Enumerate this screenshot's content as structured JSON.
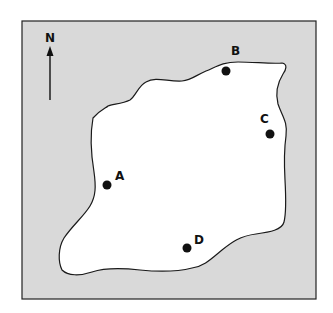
{
  "figure": {
    "compass_label": "N",
    "background_color": "#d9d9d9",
    "island_color": "#ffffff",
    "outline_color": "#1a1a1a",
    "points": [
      {
        "label": "A",
        "dot": [
          107,
          185
        ],
        "label_pos": [
          115,
          180
        ]
      },
      {
        "label": "B",
        "dot": [
          226,
          71
        ],
        "label_pos": [
          231,
          55
        ]
      },
      {
        "label": "C",
        "dot": [
          270,
          134
        ],
        "label_pos": [
          260,
          123
        ]
      },
      {
        "label": "D",
        "dot": [
          187,
          248
        ],
        "label_pos": [
          194,
          244
        ]
      }
    ]
  }
}
